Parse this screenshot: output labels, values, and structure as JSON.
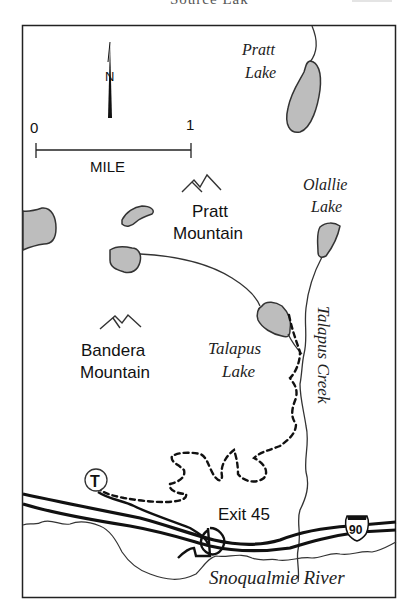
{
  "header": {
    "title": "Source Lak"
  },
  "map": {
    "compass": {
      "label": "N"
    },
    "scale": {
      "start": "0",
      "end": "1",
      "unit": "MILE"
    },
    "lakes": [
      {
        "name_line1": "Pratt",
        "name_line2": "Lake"
      },
      {
        "name_line1": "Olallie",
        "name_line2": "Lake"
      },
      {
        "name_line1": "Talapus",
        "name_line2": "Lake"
      }
    ],
    "peaks": [
      {
        "name_line1": "Pratt",
        "name_line2": "Mountain"
      },
      {
        "name_line1": "Bandera",
        "name_line2": "Mountain"
      }
    ],
    "streams": [
      {
        "name": "Talapus Creek"
      }
    ],
    "river": {
      "name": "Snoqualmie River"
    },
    "trailhead": {
      "symbol": "T"
    },
    "exit": {
      "label": "Exit 45"
    },
    "highway": {
      "shield": "90"
    },
    "colors": {
      "lake_fill": "#bdbdbd",
      "line": "#111111",
      "background": "#ffffff"
    }
  }
}
